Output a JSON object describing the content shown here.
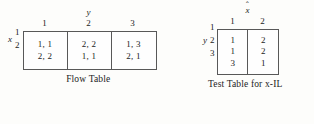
{
  "figure": {
    "background_color": "#fdfdfb",
    "ink_color": "#1c1c1c",
    "border_color": "#585858"
  },
  "flow_table": {
    "caption": "Flow Table",
    "row_variable": "x",
    "col_variable": "y",
    "col_variable_accent": "",
    "col_headers": [
      "1",
      "2",
      "3"
    ],
    "row_headers": [
      "1",
      "2"
    ],
    "cells": [
      {
        "top": "1, 1",
        "bottom": "2, 2"
      },
      {
        "top": "2, 2",
        "bottom": "1, 1"
      },
      {
        "top": "1, 3",
        "bottom": "2, 1"
      }
    ]
  },
  "test_table": {
    "caption": "Test Table for x-IL",
    "row_variable": "y",
    "col_variable": "x",
    "col_variable_accent": "ˆ",
    "col_headers": [
      "1",
      "2"
    ],
    "row_headers": [
      "1",
      "2",
      "3"
    ],
    "columns": [
      {
        "values": [
          "1",
          "1",
          "3"
        ]
      },
      {
        "values": [
          "2",
          "2",
          "1"
        ]
      }
    ]
  }
}
